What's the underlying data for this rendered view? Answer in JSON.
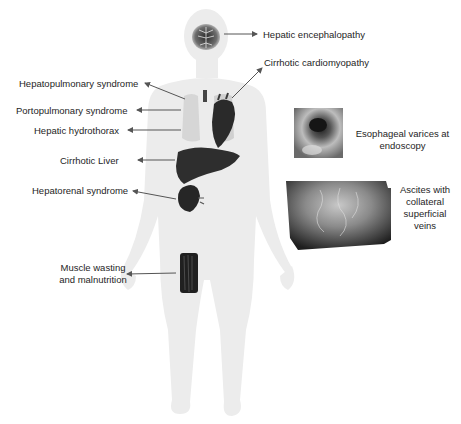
{
  "diagram": {
    "colors": {
      "body": "#ececec",
      "arrow": "#555555",
      "organ_dark": "#2a2a2a",
      "lung": "#d8d8d8",
      "text": "#1e1e1e"
    },
    "labels": {
      "hepatic_encephalopathy": "Hepatic encephalopathy",
      "cirrhotic_cardiomyopathy": "Cirrhotic cardiomyopathy",
      "hepatopulmonary_syndrome": "Hepatopulmonary syndrome",
      "portopulmonary_syndrome": "Portopulmonary syndrome",
      "hepatic_hydrothorax": "Hepatic hydrothorax",
      "cirrhotic_liver": "Cirrhotic Liver",
      "hepatorenal_syndrome": "Hepatorenal syndrome",
      "muscle_wasting_line1": "Muscle wasting",
      "muscle_wasting_line2": "and malnutrition",
      "esophageal_varices_line1": "Esophageal varices at",
      "esophageal_varices_line2": "endoscopy",
      "ascites_line1": "Ascites with",
      "ascites_line2": "collateral",
      "ascites_line3": "superficial",
      "ascites_line4": "veins"
    },
    "icons": [
      "brain-icon",
      "lungs-icon",
      "heart-icon",
      "liver-icon",
      "kidney-icon",
      "thigh-muscle-icon",
      "endoscopy-image",
      "abdomen-veins-image"
    ]
  }
}
